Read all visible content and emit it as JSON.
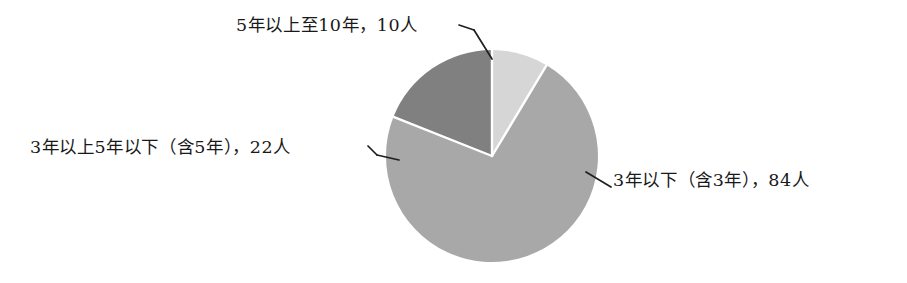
{
  "chart_data": {
    "type": "pie",
    "title": "",
    "subtitle": "",
    "xlabel": "",
    "ylabel": "",
    "grid": false,
    "legend_position": "none",
    "label_style": "outside-with-leader-lines",
    "start_angle_deg": 0,
    "direction": "clockwise",
    "unit": "人",
    "total": 116,
    "categories": [
      "3年以下（含3年）",
      "3年以上5年以下（含5年）",
      "5年以上至10年"
    ],
    "values": [
      84,
      22,
      10
    ],
    "labels": [
      "3年以下（含3年），84人",
      "3年以上5年以下（含5年），22人",
      "5年以上至10年，10人"
    ],
    "slices": [
      {
        "category": "5年以上至10年",
        "label": "5年以上至10年，10人",
        "value": 10,
        "color": "#d6d6d6",
        "start_deg": 0,
        "end_deg": 31
      },
      {
        "category": "3年以下（含3年）",
        "label": "3年以下（含3年），84人",
        "value": 84,
        "color": "#a8a8a8",
        "start_deg": 31,
        "end_deg": 292
      },
      {
        "category": "3年以上5年以下（含5年）",
        "label": "3年以上5年以下（含5年），22人",
        "value": 22,
        "color": "#808080",
        "start_deg": 292,
        "end_deg": 360
      }
    ]
  },
  "colors": {
    "background": "#ffffff",
    "slice_low": "#a8a8a8",
    "slice_mid": "#808080",
    "slice_high": "#d6d6d6",
    "separator": "#ffffff",
    "leader_line": "#1f1f1f",
    "text": "#191919"
  }
}
